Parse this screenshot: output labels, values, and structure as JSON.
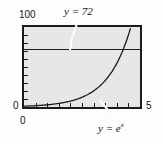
{
  "chart_data": {
    "type": "line",
    "title": "",
    "xlabel": "",
    "ylabel": "",
    "xlim": [
      0,
      5
    ],
    "ylim": [
      0,
      100
    ],
    "grid": false,
    "legend_position": "inline-annotation",
    "x_ticks": [
      "0",
      "5"
    ],
    "y_ticks": [
      "0",
      "100"
    ],
    "x_tick_count": 10,
    "y_tick_count": 10,
    "background_color": "#e7e7e7",
    "frame_color": "#1b1b1b",
    "series": [
      {
        "name": "y = e^x",
        "type": "curve",
        "equation": "exp(x)",
        "annotation": "y = e",
        "annotation_exponent": "x",
        "color": "#1b1b1b",
        "x": [
          0,
          0.5,
          1,
          1.5,
          2,
          2.5,
          3,
          3.5,
          4,
          4.25,
          4.5,
          4.6
        ],
        "values": [
          1,
          1.65,
          2.72,
          4.48,
          7.39,
          12.18,
          20.09,
          33.12,
          54.6,
          70.1,
          90.0,
          99.5
        ]
      },
      {
        "name": "y = 72",
        "type": "horizontal-line",
        "annotation": "y = 72",
        "color": "#1b1b1b",
        "y_value": 72
      }
    ],
    "intersection": {
      "x": 4.277,
      "y": 72
    }
  },
  "labels": {
    "y_max": "100",
    "y_zero": "0",
    "x_zero": "0",
    "x_max": "5",
    "callout_line": "y = 72",
    "callout_curve_base": "y = e",
    "callout_curve_exp": "x"
  }
}
